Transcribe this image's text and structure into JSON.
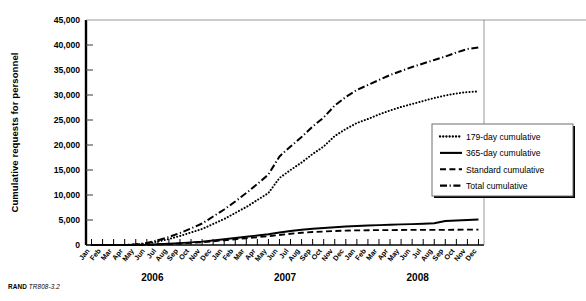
{
  "figure": {
    "credit_brand": "RAND",
    "credit_id": "TR808-3.2"
  },
  "chart_data": {
    "type": "line",
    "title": "",
    "xlabel": "",
    "ylabel": "Cumulative requests for personnel",
    "ylim": [
      0,
      45000
    ],
    "yticks": [
      0,
      5000,
      10000,
      15000,
      20000,
      25000,
      30000,
      35000,
      40000,
      45000
    ],
    "ytick_labels": [
      "0",
      "5,000",
      "10,000",
      "15,000",
      "20,000",
      "25,000",
      "30,000",
      "35,000",
      "40,000",
      "45,000"
    ],
    "grid": false,
    "legend_position": "right-middle",
    "x": [
      "Jan 2006",
      "Feb 2006",
      "Mar 2006",
      "Apr 2006",
      "May 2006",
      "Jun 2006",
      "Jul 2006",
      "Aug 2006",
      "Sep 2006",
      "Oct 2006",
      "Nov 2006",
      "Dec 2006",
      "Jan 2007",
      "Feb 2007",
      "Mar 2007",
      "Apr 2007",
      "May 2007",
      "Jun 2007",
      "Jul 2007",
      "Aug 2007",
      "Sep 2007",
      "Oct 2007",
      "Nov 2007",
      "Dec 2007",
      "Jan 2008",
      "Feb 2008",
      "Mar 2008",
      "Apr 2008",
      "May 2008",
      "Jun 2008",
      "Jul 2008",
      "Aug 2008",
      "Sep 2008",
      "Oct 2008",
      "Nov 2008",
      "Dec 2008"
    ],
    "xtick_labels": [
      "Jan",
      "Feb",
      "Mar",
      "Apr",
      "May",
      "Jun",
      "Jul",
      "Aug",
      "Sep",
      "Oct",
      "Nov",
      "Dec",
      "Jan",
      "Feb",
      "Mar",
      "Apr",
      "May",
      "Jun",
      "Jul",
      "Aug",
      "Sep",
      "Oct",
      "Nov",
      "Dec",
      "Jan",
      "Feb",
      "Mar",
      "Apr",
      "May",
      "Jun",
      "Jul",
      "Aug",
      "Sep",
      "Oct",
      "Nov",
      "Dec"
    ],
    "year_groups": [
      {
        "label": "2006",
        "start_index": 0,
        "end_index": 11
      },
      {
        "label": "2007",
        "start_index": 12,
        "end_index": 23
      },
      {
        "label": "2008",
        "start_index": 24,
        "end_index": 35
      }
    ],
    "series": [
      {
        "name": "179-day cumulative",
        "style": "dotted",
        "values": [
          0,
          0,
          0,
          0,
          100,
          300,
          700,
          1200,
          1800,
          2500,
          3200,
          4200,
          5200,
          6400,
          7600,
          9000,
          10400,
          13400,
          15000,
          16500,
          18200,
          19700,
          21800,
          23200,
          24400,
          25200,
          26100,
          26900,
          27600,
          28200,
          28800,
          29400,
          29900,
          30300,
          30600,
          30700
        ]
      },
      {
        "name": "365-day cumulative",
        "style": "solid",
        "values": [
          0,
          0,
          0,
          0,
          20,
          60,
          150,
          260,
          380,
          520,
          680,
          900,
          1150,
          1400,
          1650,
          1900,
          2150,
          2500,
          2800,
          3050,
          3250,
          3400,
          3550,
          3700,
          3800,
          3900,
          3980,
          4050,
          4120,
          4180,
          4250,
          4350,
          4800,
          4900,
          5000,
          5100
        ]
      },
      {
        "name": "Standard cumulative",
        "style": "dashed",
        "values": [
          0,
          0,
          0,
          0,
          15,
          45,
          110,
          200,
          300,
          420,
          560,
          740,
          950,
          1150,
          1350,
          1550,
          1750,
          2000,
          2250,
          2450,
          2600,
          2700,
          2800,
          2880,
          2920,
          2950,
          2970,
          2990,
          3000,
          3010,
          3020,
          3030,
          3040,
          3050,
          3060,
          3070
        ]
      },
      {
        "name": "Total cumulative",
        "style": "dashdot",
        "values": [
          0,
          0,
          0,
          0,
          130,
          400,
          950,
          1600,
          2400,
          3300,
          4300,
          5700,
          7100,
          8700,
          10400,
          12200,
          14100,
          17700,
          19700,
          21600,
          23700,
          25500,
          27900,
          29600,
          31000,
          32000,
          33000,
          34000,
          34800,
          35600,
          36300,
          37000,
          37700,
          38500,
          39200,
          39500
        ]
      }
    ]
  },
  "legend": {
    "items": [
      {
        "label": "179-day cumulative",
        "style": "dotted"
      },
      {
        "label": "365-day cumulative",
        "style": "solid"
      },
      {
        "label": "Standard cumulative",
        "style": "dashed"
      },
      {
        "label": "Total cumulative",
        "style": "dashdot"
      }
    ]
  }
}
